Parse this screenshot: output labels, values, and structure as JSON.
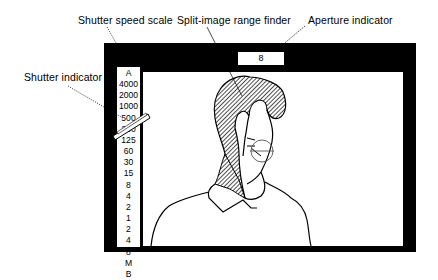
{
  "labels": {
    "shutter_speed_scale": "Shutter speed scale",
    "split_image_range_finder": "Split-image range finder",
    "aperture_indicator": "Aperture indicator",
    "shutter_indicator": "Shutter indicator"
  },
  "aperture_value": "8",
  "shutter_scale": [
    "A",
    "4000",
    "2000",
    "1000",
    "500",
    "250",
    "125",
    "60",
    "30",
    "15",
    "8",
    "4",
    "2",
    "1",
    "2",
    "4",
    "8",
    "M",
    "B"
  ],
  "colors": {
    "frame": "#000000",
    "background": "#ffffff",
    "hatch": "#333333"
  }
}
